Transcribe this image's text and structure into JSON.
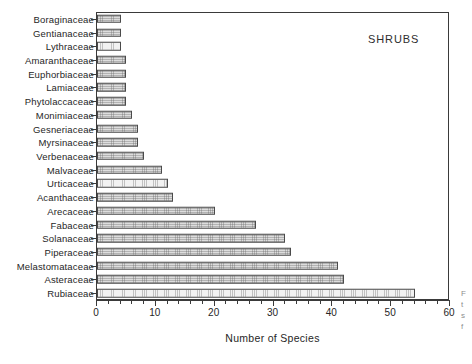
{
  "panel": {
    "label": "SHRUBS"
  },
  "axis": {
    "xlabel": "Number of Species",
    "xticks": [
      0,
      10,
      20,
      30,
      40,
      50,
      60
    ],
    "xmin": 0,
    "xmax": 60,
    "minor_tick_step": 2
  },
  "margin_note": {
    "lines": [
      "F",
      "t",
      "s",
      "f"
    ]
  },
  "chart_data": {
    "type": "bar",
    "orientation": "horizontal",
    "title": "SHRUBS",
    "xlabel": "Number of Species",
    "ylabel": "",
    "xlim": [
      0,
      60
    ],
    "grid": false,
    "legend": null,
    "categories": [
      "Boraginaceae",
      "Gentianaceae",
      "Lythraceae",
      "Amaranthaceae",
      "Euphorbiaceae",
      "Lamiaceae",
      "Phytolaccaceae",
      "Monimiaceae",
      "Gesneriaceae",
      "Myrsinaceae",
      "Verbenaceae",
      "Malvaceae",
      "Urticaceae",
      "Acanthaceae",
      "Arecaceae",
      "Fabaceae",
      "Solanaceae",
      "Piperaceae",
      "Melastomataceae",
      "Asteraceae",
      "Rubiaceae"
    ],
    "values": [
      4,
      4,
      4,
      5,
      5,
      5,
      5,
      6,
      7,
      7,
      8,
      11,
      12,
      13,
      20,
      27,
      32,
      33,
      41,
      42,
      54
    ]
  }
}
